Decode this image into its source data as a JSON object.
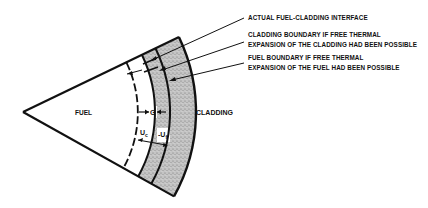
{
  "diagram": {
    "regions": {
      "fuel_label": "FUEL",
      "cladding_label": "CLADDING"
    },
    "dimensions": {
      "gap_label": "G",
      "uc_label": "U",
      "uc_sub": "c",
      "uf_label": "U",
      "uf_sub": "f"
    },
    "annotations": [
      {
        "line1": "ACTUAL FUEL-CLADDING INTERFACE",
        "line2": ""
      },
      {
        "line1": "CLADDING BOUNDARY IF FREE THERMAL",
        "line2": "EXPANSION OF THE CLADDING HAD BEEN POSSIBLE"
      },
      {
        "line1": "FUEL BOUNDARY IF FREE THERMAL",
        "line2": "EXPANSION OF THE FUEL HAD BEEN POSSIBLE"
      }
    ],
    "colors": {
      "ink": "#111111",
      "cladding_fill": "#b8b8b8",
      "background": "#ffffff"
    }
  }
}
